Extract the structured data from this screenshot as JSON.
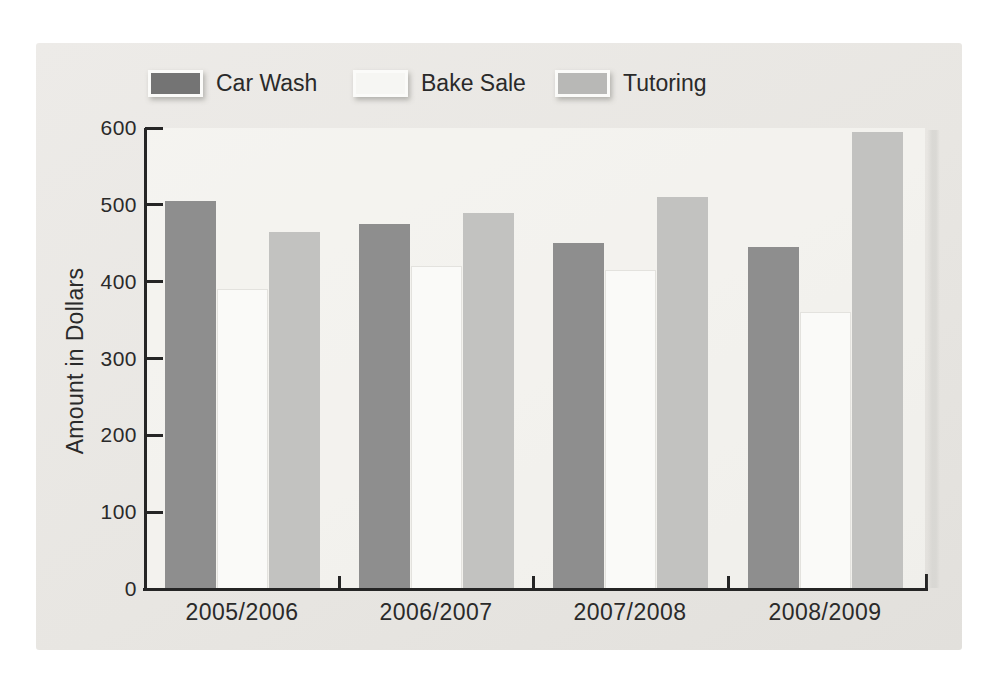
{
  "page": {
    "background": "#ffffff",
    "panel_background": "#e8e6e2"
  },
  "chart_data": {
    "type": "bar",
    "title": "",
    "xlabel": "",
    "ylabel": "Amount in Dollars",
    "ylim": [
      0,
      600
    ],
    "y_ticks": [
      0,
      100,
      200,
      300,
      400,
      500,
      600
    ],
    "grid": false,
    "legend_position": "top",
    "axis_color": "#252525",
    "text_color": "#2a2a2a",
    "categories": [
      "2005/2006",
      "2006/2007",
      "2007/2008",
      "2008/2009"
    ],
    "series": [
      {
        "name": "Car Wash",
        "color": "#8e8e8e",
        "legend_color": "#747474",
        "values": [
          505,
          475,
          450,
          445
        ]
      },
      {
        "name": "Bake Sale",
        "color": "#fafaf8",
        "legend_color": "#f6f6f3",
        "edge_color": "#e3e2de",
        "values": [
          390,
          420,
          415,
          360
        ]
      },
      {
        "name": "Tutoring",
        "color": "#c2c2c0",
        "legend_color": "#b8b8b6",
        "values": [
          465,
          490,
          510,
          595
        ]
      }
    ]
  }
}
